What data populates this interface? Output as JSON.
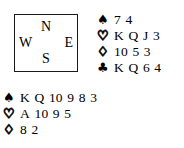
{
  "diagram": {
    "kind": "bridge-hand-diagram",
    "compass": {
      "north_label": "N",
      "south_label": "S",
      "east_label": "E",
      "west_label": "W"
    },
    "suit_glyphs": {
      "spade": "♠",
      "heart": "♡",
      "diamond": "♢",
      "club": "♣"
    },
    "hands": [
      {
        "position": "north",
        "suits": [
          {
            "suit": "spade",
            "style": "solid",
            "ranks": [
              "7",
              "4"
            ]
          },
          {
            "suit": "heart",
            "style": "outlined",
            "ranks": [
              "K",
              "Q",
              "J",
              "3"
            ]
          },
          {
            "suit": "diamond",
            "style": "outlined",
            "ranks": [
              "10",
              "5",
              "3"
            ]
          },
          {
            "suit": "club",
            "style": "solid",
            "ranks": [
              "K",
              "Q",
              "6",
              "4"
            ]
          }
        ]
      },
      {
        "position": "south",
        "suits": [
          {
            "suit": "spade",
            "style": "solid",
            "ranks": [
              "K",
              "Q",
              "10",
              "9",
              "8",
              "3"
            ]
          },
          {
            "suit": "heart",
            "style": "outlined",
            "ranks": [
              "A",
              "10",
              "9",
              "5"
            ]
          },
          {
            "suit": "diamond",
            "style": "outlined",
            "ranks": [
              "8",
              "2"
            ]
          }
        ]
      }
    ]
  },
  "colors": {
    "ink": "#000000",
    "background": "#ffffff",
    "box_border": "#1a1a1a"
  }
}
